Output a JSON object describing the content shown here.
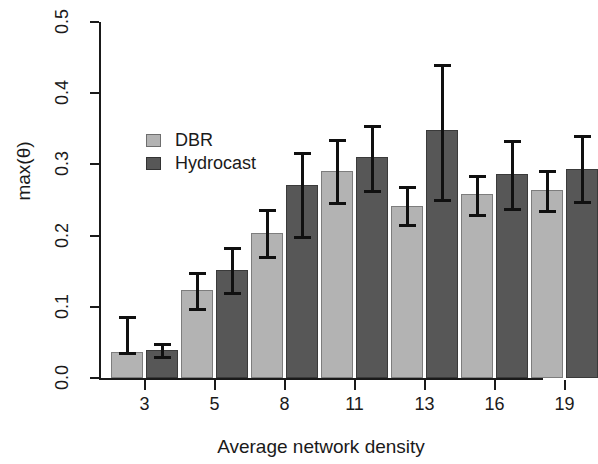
{
  "chart_data": {
    "type": "bar",
    "title": "",
    "xlabel": "Average network density",
    "ylabel": "max(θ)",
    "categories": [
      "3",
      "5",
      "8",
      "11",
      "13",
      "16",
      "19"
    ],
    "ylim": [
      0.0,
      0.5
    ],
    "y_ticks": [
      "0.0",
      "0.1",
      "0.2",
      "0.3",
      "0.4",
      "0.5"
    ],
    "y_tick_values": [
      0.0,
      0.1,
      0.2,
      0.3,
      0.4,
      0.5
    ],
    "grid": false,
    "legend_position": "upper-left-inside",
    "series": [
      {
        "name": "DBR",
        "color": "#b3b3b3",
        "values": [
          0.037,
          0.124,
          0.204,
          0.291,
          0.242,
          0.258,
          0.264
        ],
        "err_low": [
          0.037,
          0.099,
          0.172,
          0.247,
          0.216,
          0.231,
          0.236
        ],
        "err_high": [
          0.087,
          0.149,
          0.237,
          0.335,
          0.269,
          0.285,
          0.292
        ]
      },
      {
        "name": "Hydrocast",
        "color": "#575757",
        "values": [
          0.04,
          0.152,
          0.271,
          0.31,
          0.349,
          0.287,
          0.294
        ],
        "err_low": [
          0.031,
          0.121,
          0.199,
          0.264,
          0.252,
          0.239,
          0.248
        ],
        "err_high": [
          0.049,
          0.184,
          0.318,
          0.356,
          0.441,
          0.334,
          0.341
        ]
      }
    ]
  },
  "axes": {
    "y_title": "max(θ)",
    "x_title": "Average network density"
  },
  "legend": {
    "items": [
      {
        "label": "DBR",
        "swatch": "light"
      },
      {
        "label": "Hydrocast",
        "swatch": "dark"
      }
    ]
  }
}
